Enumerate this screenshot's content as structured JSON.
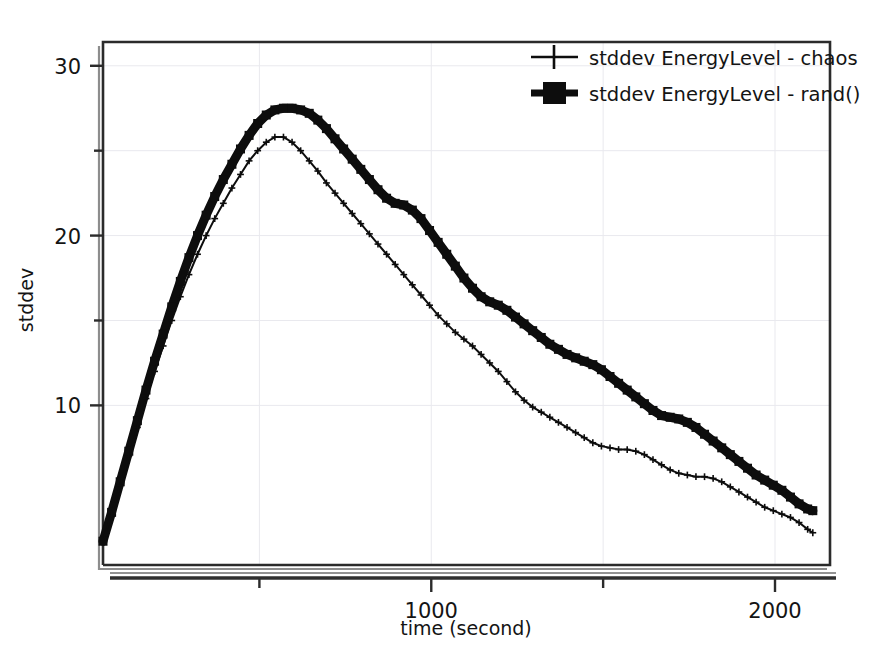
{
  "chart_data": {
    "type": "line",
    "title": "",
    "xlabel": "time (second)",
    "ylabel": "stddev",
    "xlim": [
      45,
      2160
    ],
    "ylim": [
      0.6,
      31.4
    ],
    "grid": "faint",
    "legend_position": "top-right",
    "x_ticks_major": [
      1000,
      2000
    ],
    "x_ticks_minor": [
      500,
      1500
    ],
    "x_tick_labels": [
      "1000",
      "2000"
    ],
    "y_ticks_major": [
      10,
      20,
      30
    ],
    "y_ticks_minor": [
      15,
      25
    ],
    "y_tick_labels": [
      "10",
      "20",
      "30"
    ],
    "series": [
      {
        "name": "stddev EnergyLevel - chaos",
        "marker": "plus",
        "linewidth": "thin",
        "color": "#0d0d0d",
        "x": [
          45,
          70,
          95,
          120,
          145,
          170,
          195,
          220,
          245,
          270,
          295,
          320,
          345,
          370,
          395,
          420,
          445,
          470,
          495,
          520,
          545,
          570,
          595,
          620,
          645,
          670,
          695,
          720,
          745,
          770,
          795,
          820,
          845,
          870,
          895,
          920,
          945,
          970,
          995,
          1020,
          1045,
          1070,
          1095,
          1120,
          1145,
          1170,
          1195,
          1220,
          1245,
          1270,
          1295,
          1320,
          1345,
          1370,
          1395,
          1420,
          1445,
          1470,
          1495,
          1520,
          1545,
          1570,
          1595,
          1620,
          1645,
          1670,
          1695,
          1720,
          1745,
          1770,
          1795,
          1820,
          1845,
          1870,
          1895,
          1920,
          1945,
          1970,
          1995,
          2020,
          2045,
          2070,
          2095,
          2110
        ],
        "y": [
          2.0,
          3.6,
          5.3,
          7.0,
          8.7,
          10.4,
          12.0,
          13.5,
          15.0,
          16.4,
          17.7,
          18.9,
          20.0,
          21.0,
          21.9,
          22.8,
          23.6,
          24.4,
          25.0,
          25.5,
          25.8,
          25.8,
          25.5,
          25.0,
          24.4,
          23.8,
          23.1,
          22.5,
          21.9,
          21.3,
          20.7,
          20.1,
          19.5,
          18.9,
          18.3,
          17.7,
          17.1,
          16.5,
          15.9,
          15.3,
          14.8,
          14.3,
          13.9,
          13.5,
          13.0,
          12.5,
          12.0,
          11.4,
          10.8,
          10.3,
          9.9,
          9.6,
          9.3,
          9.0,
          8.7,
          8.4,
          8.1,
          7.8,
          7.6,
          7.5,
          7.4,
          7.4,
          7.3,
          7.1,
          6.8,
          6.5,
          6.2,
          6.0,
          5.9,
          5.8,
          5.8,
          5.7,
          5.5,
          5.2,
          4.9,
          4.6,
          4.3,
          4.0,
          3.8,
          3.6,
          3.4,
          3.1,
          2.7,
          2.5
        ]
      },
      {
        "name": "stddev EnergyLevel - rand()",
        "marker": "square",
        "linewidth": "thick",
        "color": "#0d0d0d",
        "x": [
          45,
          70,
          95,
          120,
          145,
          170,
          195,
          220,
          245,
          270,
          295,
          320,
          345,
          370,
          395,
          420,
          445,
          470,
          495,
          520,
          545,
          570,
          595,
          620,
          645,
          670,
          695,
          720,
          745,
          770,
          795,
          820,
          845,
          870,
          895,
          920,
          945,
          970,
          995,
          1020,
          1045,
          1070,
          1095,
          1120,
          1145,
          1170,
          1195,
          1220,
          1245,
          1270,
          1295,
          1320,
          1345,
          1370,
          1395,
          1420,
          1445,
          1470,
          1495,
          1520,
          1545,
          1570,
          1595,
          1620,
          1645,
          1670,
          1695,
          1720,
          1745,
          1770,
          1795,
          1820,
          1845,
          1870,
          1895,
          1920,
          1945,
          1970,
          1995,
          2020,
          2045,
          2070,
          2095,
          2110
        ],
        "y": [
          2.0,
          3.7,
          5.5,
          7.3,
          9.1,
          10.9,
          12.6,
          14.2,
          15.8,
          17.3,
          18.7,
          20.0,
          21.2,
          22.3,
          23.3,
          24.2,
          25.1,
          25.9,
          26.6,
          27.1,
          27.4,
          27.5,
          27.5,
          27.4,
          27.2,
          26.8,
          26.3,
          25.7,
          25.1,
          24.5,
          23.9,
          23.3,
          22.7,
          22.2,
          21.9,
          21.8,
          21.5,
          21.0,
          20.3,
          19.6,
          18.9,
          18.2,
          17.5,
          16.9,
          16.4,
          16.1,
          15.9,
          15.6,
          15.2,
          14.8,
          14.4,
          14.0,
          13.6,
          13.3,
          13.0,
          12.8,
          12.6,
          12.4,
          12.1,
          11.7,
          11.3,
          10.9,
          10.5,
          10.1,
          9.7,
          9.4,
          9.3,
          9.2,
          9.0,
          8.7,
          8.3,
          7.9,
          7.5,
          7.1,
          6.7,
          6.3,
          5.9,
          5.6,
          5.3,
          5.0,
          4.6,
          4.2,
          3.9,
          3.8
        ]
      }
    ],
    "legend": [
      {
        "label": "stddev EnergyLevel - chaos",
        "marker": "plus"
      },
      {
        "label": "stddev EnergyLevel - rand()",
        "marker": "square"
      }
    ]
  },
  "axes": {
    "x_title": "time (second)",
    "y_title": "stddev"
  },
  "colors": {
    "ink": "#0d0d0d",
    "frame": "#2b2b2b",
    "grid": "#e9e9ee",
    "background": "#ffffff"
  }
}
